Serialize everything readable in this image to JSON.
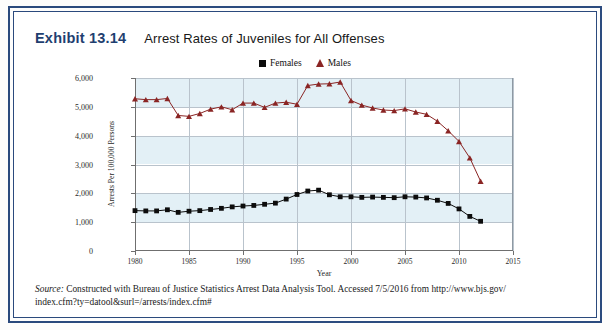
{
  "exhibit": {
    "number": "Exhibit 13.14",
    "title": "Arrest Rates of Juveniles for All Offenses"
  },
  "source": {
    "label": "Source:",
    "line1": " Constructed with Bureau of Justice Statistics Arrest Data Analysis Tool. Accessed 7/5/2016 from http://www.bjs.gov/",
    "line2": "index.cfm?ty=datool&surl=/arrests/index.cfm#"
  },
  "colors": {
    "frame": "#2b4a7d",
    "exhibit_number": "#1f3f70",
    "females": "#0c0c0c",
    "males": "#8a2524",
    "band": "#e3f0f6",
    "grid": "#b9c3cc"
  },
  "chart_data": {
    "type": "line",
    "title": "Arrest Rates of Juveniles for All Offenses",
    "xlabel": "Year",
    "ylabel": "Arrests Per 100,000 Persons",
    "xlim": [
      1980,
      2015
    ],
    "ylim": [
      0,
      6000
    ],
    "xticks": [
      1980,
      1985,
      1990,
      1995,
      2000,
      2005,
      2010,
      2015
    ],
    "yticks": [
      0,
      1000,
      2000,
      3000,
      4000,
      5000,
      6000
    ],
    "ytick_labels": [
      "0",
      "1,000",
      "2,000",
      "3,000",
      "4,000",
      "5,000",
      "6,000"
    ],
    "grid": true,
    "legend_position": "top-center",
    "x": [
      1980,
      1981,
      1982,
      1983,
      1984,
      1985,
      1986,
      1987,
      1988,
      1989,
      1990,
      1991,
      1992,
      1993,
      1994,
      1995,
      1996,
      1997,
      1998,
      1999,
      2000,
      2001,
      2002,
      2003,
      2004,
      2005,
      2006,
      2007,
      2008,
      2009,
      2010,
      2011,
      2012
    ],
    "series": [
      {
        "name": "Females",
        "marker": "square",
        "color": "#0c0c0c",
        "values": [
          1400,
          1390,
          1390,
          1430,
          1340,
          1380,
          1400,
          1440,
          1480,
          1530,
          1560,
          1580,
          1620,
          1660,
          1800,
          1960,
          2080,
          2110,
          1950,
          1880,
          1880,
          1860,
          1870,
          1860,
          1850,
          1880,
          1870,
          1840,
          1760,
          1650,
          1460,
          1200,
          1030
        ]
      },
      {
        "name": "Males",
        "marker": "triangle",
        "color": "#8a2524",
        "values": [
          5280,
          5250,
          5250,
          5290,
          4700,
          4670,
          4770,
          4920,
          5000,
          4900,
          5130,
          5130,
          4980,
          5130,
          5160,
          5090,
          5740,
          5790,
          5800,
          5860,
          5220,
          5060,
          4960,
          4890,
          4870,
          4930,
          4820,
          4740,
          4500,
          4170,
          3800,
          3230,
          2420
        ]
      }
    ]
  }
}
